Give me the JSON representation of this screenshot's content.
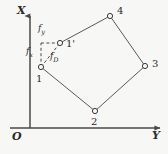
{
  "figure": {
    "name": "quadrilateral-element-force-decomposition",
    "background_color": "#f7f7f5",
    "line_color": "#4a4a4a",
    "text_color": "#2b2b2b"
  },
  "axes": {
    "vertical": {
      "label": "X",
      "origin_px": [
        30,
        128
      ],
      "tip_px": [
        30,
        14
      ]
    },
    "horizontal": {
      "label": "Y",
      "origin_px": [
        10,
        128
      ],
      "tip_px": [
        162,
        128
      ]
    },
    "origin": {
      "label": "O"
    }
  },
  "nodes": [
    {
      "id": "1",
      "label": "1",
      "x_px": 41,
      "y_px": 67,
      "label_dx": -4,
      "label_dy": 9
    },
    {
      "id": "2",
      "label": "2",
      "x_px": 95,
      "y_px": 111,
      "label_dx": -3,
      "label_dy": 8
    },
    {
      "id": "3",
      "label": "3",
      "x_px": 145,
      "y_px": 66,
      "label_dx": 6,
      "label_dy": -5
    },
    {
      "id": "4",
      "label": "4",
      "x_px": 110,
      "y_px": 16,
      "label_dx": 6,
      "label_dy": -8
    },
    {
      "id": "1p",
      "label": "1'",
      "x_px": 60,
      "y_px": 43,
      "label_dx": 6,
      "label_dy": -3
    }
  ],
  "element_edges": [
    [
      "1",
      "2"
    ],
    [
      "2",
      "3"
    ],
    [
      "3",
      "4"
    ],
    [
      "4",
      "1p"
    ]
  ],
  "displacement_triangle": {
    "corner_px": [
      41,
      43
    ],
    "from_node": "1",
    "to_node": "1p",
    "style": "dashed",
    "components": [
      {
        "name": "f_y",
        "label": "f",
        "subscript": "y",
        "direction": "horizontal",
        "label_px": [
          38,
          26
        ]
      },
      {
        "name": "f_x",
        "label": "f",
        "subscript": "x",
        "direction": "vertical",
        "label_px": [
          27,
          48
        ]
      },
      {
        "name": "f_D",
        "label": "f",
        "subscript": "D",
        "direction": "diagonal",
        "label_px": [
          50,
          53
        ]
      }
    ]
  }
}
